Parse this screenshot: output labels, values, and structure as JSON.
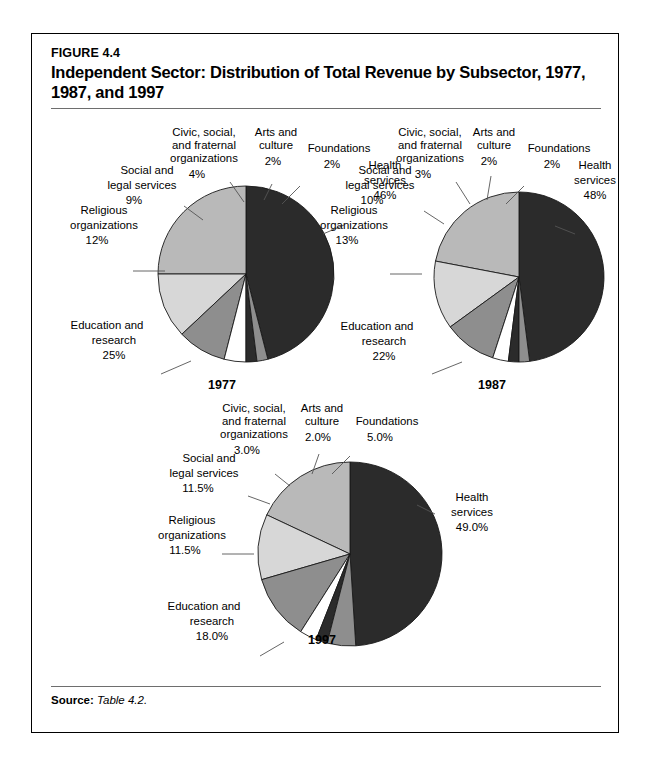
{
  "figure": {
    "number": "FIGURE 4.4",
    "title": "Independent Sector: Distribution of Total Revenue by Subsector, 1977, 1987, and 1997",
    "source_label": "Source:",
    "source_value": "Table 4.2."
  },
  "colors": {
    "health": "#2b2b2b",
    "foundations": "#8e8e8e",
    "arts": "#2b2b2b",
    "civic": "#ffffff",
    "social_legal": "#8e8e8e",
    "religious": "#d7d7d7",
    "education": "#b9b9b9",
    "outline": "#1a1a1a",
    "rule": "#6e6e6e"
  },
  "chart_data": [
    {
      "type": "pie",
      "title": "1977",
      "labels": [
        "Health services",
        "Foundations",
        "Arts and culture",
        "Civic, social, and fraternal organizations",
        "Social and legal services",
        "Religious organizations",
        "Education and research"
      ],
      "values": [
        46,
        2,
        2,
        4,
        9,
        12,
        25
      ],
      "value_texts": [
        "46%",
        "2%",
        "2%",
        "4%",
        "9%",
        "12%",
        "25%"
      ],
      "legend": "none"
    },
    {
      "type": "pie",
      "title": "1987",
      "labels": [
        "Health services",
        "Foundations",
        "Arts and culture",
        "Civic, social, and fraternal organizations",
        "Social and legal services",
        "Religious organizations",
        "Education and research"
      ],
      "values": [
        48,
        2,
        2,
        3,
        10,
        13,
        22
      ],
      "value_texts": [
        "48%",
        "2%",
        "2%",
        "3%",
        "10%",
        "13%",
        "22%"
      ],
      "legend": "none"
    },
    {
      "type": "pie",
      "title": "1997",
      "labels": [
        "Health services",
        "Foundations",
        "Arts and culture",
        "Civic, social, and fraternal organizations",
        "Social and legal services",
        "Religious organizations",
        "Education and research"
      ],
      "values": [
        49.0,
        5.0,
        2.0,
        3.0,
        11.5,
        11.5,
        18.0
      ],
      "value_texts": [
        "49.0%",
        "5.0%",
        "2.0%",
        "3.0%",
        "11.5%",
        "11.5%",
        "18.0%"
      ],
      "legend": "none"
    }
  ],
  "pie1977": {
    "year": "1977",
    "health_l1": "Health",
    "health_l2": "services",
    "health_pct": "46%",
    "foundations_l1": "Foundations",
    "foundations_pct": "2%",
    "arts_l1": "Arts and",
    "arts_l2": "culture",
    "arts_pct": "2%",
    "civic_l1": "Civic, social,",
    "civic_l2": "and fraternal",
    "civic_l3": "organizations",
    "civic_pct": "4%",
    "social_l1": "Social and",
    "social_l2": "legal services",
    "social_pct": "9%",
    "religious_l1": "Religious",
    "religious_l2": "organizations",
    "religious_pct": "12%",
    "education_l1": "Education and",
    "education_l2": "research",
    "education_pct": "25%"
  },
  "pie1987": {
    "year": "1987",
    "health_l1": "Health",
    "health_l2": "services",
    "health_pct": "48%",
    "foundations_l1": "Foundations",
    "foundations_pct": "2%",
    "arts_l1": "Arts and",
    "arts_l2": "culture",
    "arts_pct": "2%",
    "civic_l1": "Civic, social,",
    "civic_l2": "and fraternal",
    "civic_l3": "organizations",
    "civic_pct": "3%",
    "social_l1": "Social and",
    "social_l2": "legal services",
    "social_pct": "10%",
    "religious_l1": "Religious",
    "religious_l2": "organizations",
    "religious_pct": "13%",
    "education_l1": "Education and",
    "education_l2": "research",
    "education_pct": "22%"
  },
  "pie1997": {
    "year": "1997",
    "health_l1": "Health",
    "health_l2": "services",
    "health_pct": "49.0%",
    "foundations_l1": "Foundations",
    "foundations_pct": "5.0%",
    "arts_l1": "Arts and",
    "arts_l2": "culture",
    "arts_pct": "2.0%",
    "civic_l1": "Civic, social,",
    "civic_l2": "and fraternal",
    "civic_l3": "organizations",
    "civic_pct": "3.0%",
    "social_l1": "Social and",
    "social_l2": "legal services",
    "social_pct": "11.5%",
    "religious_l1": "Religious",
    "religious_l2": "organizations",
    "religious_pct": "11.5%",
    "education_l1": "Education and",
    "education_l2": "research",
    "education_pct": "18.0%"
  }
}
